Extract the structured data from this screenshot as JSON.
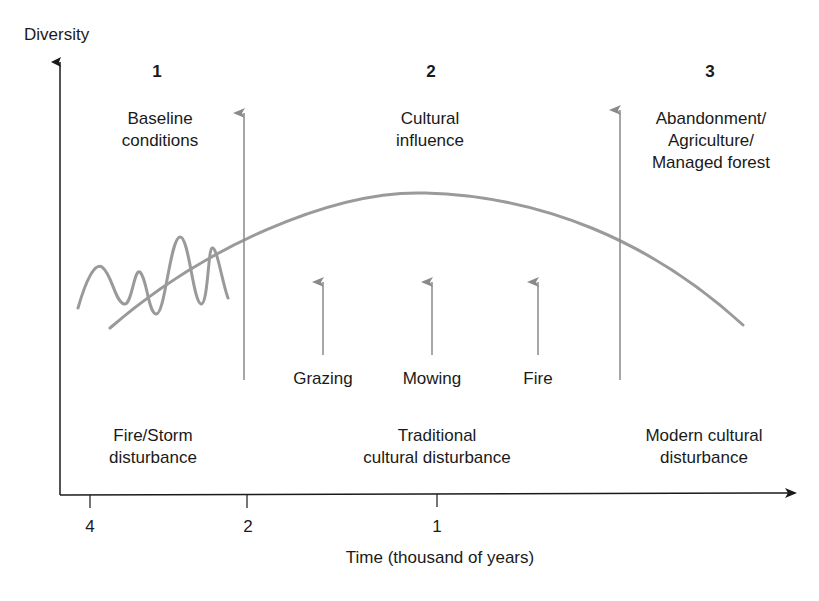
{
  "axes": {
    "y_label": "Diversity",
    "x_label": "Time (thousand of years)",
    "x_ticks": [
      "4",
      "2",
      "1"
    ]
  },
  "phases": [
    {
      "number": "1",
      "title": [
        "Baseline",
        "conditions"
      ],
      "disturbance": [
        "Fire/Storm",
        "disturbance"
      ]
    },
    {
      "number": "2",
      "title": [
        "Cultural",
        "influence"
      ],
      "disturbance": [
        "Traditional",
        "cultural disturbance"
      ]
    },
    {
      "number": "3",
      "title": [
        "Abandonment/",
        "Agriculture/",
        "Managed forest"
      ],
      "disturbance": [
        "Modern cultural",
        "disturbance"
      ]
    }
  ],
  "drivers": [
    "Grazing",
    "Mowing",
    "Fire"
  ],
  "colors": {
    "axis": "#1a1a1a",
    "curve": "#9a9a9a",
    "arrow": "#8a8a8a",
    "text": "#1a1a1a"
  }
}
